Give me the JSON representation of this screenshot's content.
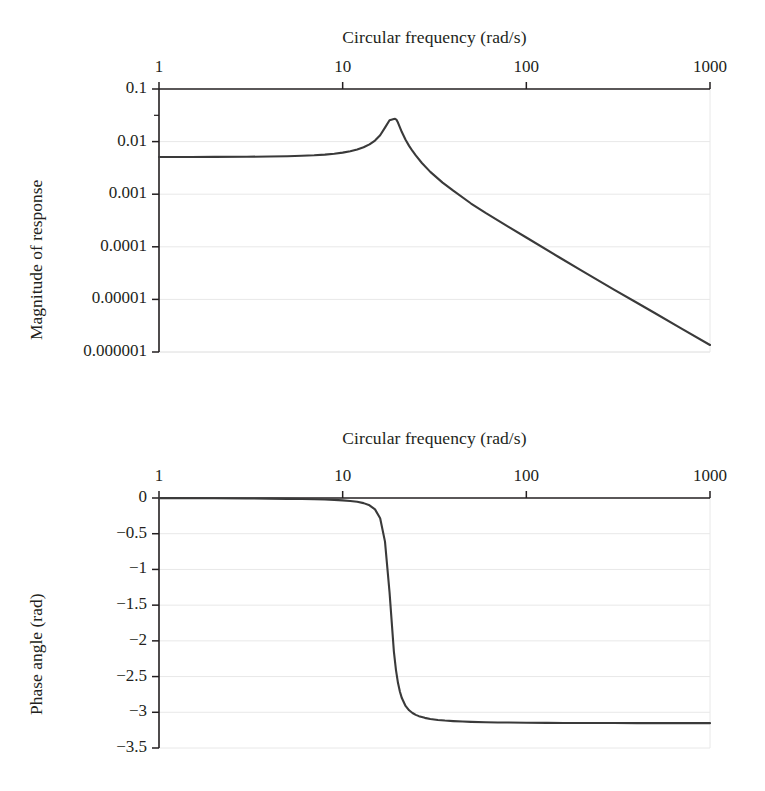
{
  "figure": {
    "background": "#ffffff",
    "ink": "#231f20",
    "grid_color": "#e8e8e8",
    "curve_color": "#3a3a3a"
  },
  "caption": "",
  "panels": [
    {
      "id": "magnitude",
      "xaxis_title": "Circular frequency (rad/s)",
      "yaxis_title": "Magnitude of response",
      "xticks": [
        "1",
        "10",
        "100",
        "1000"
      ],
      "yticks": [
        "0.1",
        "0.01",
        "0.001",
        "0.0001",
        "0.00001",
        "0.000001"
      ]
    },
    {
      "id": "phase",
      "xaxis_title": "Circular frequency (rad/s)",
      "yaxis_title": "Phase angle (rad)",
      "xticks": [
        "1",
        "10",
        "100",
        "1000"
      ],
      "yticks": [
        "0",
        "−0.5",
        "−1",
        "−1.5",
        "−2",
        "−2.5",
        "−3",
        "−3.5"
      ]
    }
  ],
  "chart_data": [
    {
      "type": "line",
      "id": "magnitude-response",
      "title": "",
      "xlabel": "Circular frequency (rad/s)",
      "ylabel": "Magnitude of response",
      "xscale": "log",
      "yscale": "log",
      "xlim": [
        1,
        1000
      ],
      "ylim": [
        1e-06,
        0.1
      ],
      "xticks": [
        1,
        10,
        100,
        1000
      ],
      "yticks": [
        0.1,
        0.01,
        0.001,
        0.0001,
        1e-05,
        1e-06
      ],
      "grid": true,
      "legend": null,
      "peak": {
        "x": 19.3,
        "y": 0.027
      },
      "x": [
        1,
        1.5,
        2,
        3,
        4,
        5,
        6,
        7,
        8,
        9,
        10,
        11,
        12,
        13,
        14,
        15,
        16,
        17,
        18,
        19,
        19.3,
        19.6,
        20,
        21,
        22,
        23,
        24,
        25,
        27,
        30,
        35,
        40,
        50,
        60,
        80,
        100,
        150,
        200,
        300,
        400,
        500,
        700,
        1000
      ],
      "y": [
        0.0051,
        0.00511,
        0.00512,
        0.00515,
        0.0052,
        0.00527,
        0.00537,
        0.00549,
        0.00566,
        0.00588,
        0.00617,
        0.00655,
        0.00707,
        0.00779,
        0.00884,
        0.01046,
        0.01318,
        0.01848,
        0.0255,
        0.0268,
        0.027,
        0.0262,
        0.023,
        0.0152,
        0.01086,
        0.0083,
        0.00663,
        0.00546,
        0.00392,
        0.00266,
        0.00166,
        0.001166,
        0.000665,
        0.00044,
        0.000239,
        0.0001502,
        6.4e-05,
        3.53e-05,
        1.54e-05,
        8.64e-06,
        5.51e-06,
        2.79e-06,
        1.36e-06
      ]
    },
    {
      "type": "line",
      "id": "phase-angle",
      "title": "",
      "xlabel": "Circular frequency (rad/s)",
      "ylabel": "Phase angle (rad)",
      "xscale": "log",
      "yscale": "linear",
      "xlim": [
        1,
        1000
      ],
      "ylim": [
        -3.5,
        0
      ],
      "xticks": [
        1,
        10,
        100,
        1000
      ],
      "yticks": [
        0,
        -0.5,
        -1,
        -1.5,
        -2,
        -2.5,
        -3,
        -3.5
      ],
      "grid": true,
      "legend": null,
      "asymptote": -3.15,
      "x": [
        1,
        2,
        3,
        4,
        5,
        6,
        7,
        8,
        9,
        10,
        11,
        12,
        13,
        14,
        15,
        16,
        17,
        18,
        19,
        19.5,
        20,
        20.5,
        21,
        22,
        23,
        24,
        25,
        26,
        28,
        30,
        33,
        36,
        40,
        45,
        50,
        60,
        70,
        80,
        100,
        130,
        160,
        200,
        300,
        400,
        600,
        1000
      ],
      "y": [
        -0.0021,
        -0.0043,
        -0.0066,
        -0.009,
        -0.0116,
        -0.0145,
        -0.0178,
        -0.0217,
        -0.0265,
        -0.0328,
        -0.0412,
        -0.0533,
        -0.0718,
        -0.1025,
        -0.1593,
        -0.2826,
        -0.6108,
        -1.321,
        -2.146,
        -2.405,
        -2.587,
        -2.713,
        -2.801,
        -2.911,
        -2.972,
        -3.01,
        -3.036,
        -3.054,
        -3.078,
        -3.093,
        -3.107,
        -3.116,
        -3.124,
        -3.13,
        -3.134,
        -3.139,
        -3.142,
        -3.144,
        -3.146,
        -3.148,
        -3.149,
        -3.15,
        -3.151,
        -3.1515,
        -3.1518,
        -3.152
      ]
    }
  ]
}
